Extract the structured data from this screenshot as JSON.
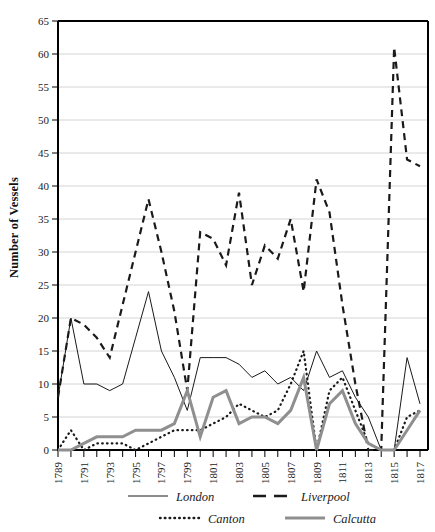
{
  "chart_data": {
    "type": "line",
    "title": "",
    "xlabel": "",
    "ylabel": "Number of Vessels",
    "xlim": [
      1789,
      1817
    ],
    "ylim": [
      0,
      65
    ],
    "ytick_step": 5,
    "xtick_step": 1,
    "xtick_label_step": 2,
    "grid": true,
    "legend_position": "bottom",
    "yticks": [
      0,
      5,
      10,
      15,
      20,
      25,
      30,
      35,
      40,
      45,
      50,
      55,
      60,
      65
    ],
    "ytick_labels": [
      "0",
      "5",
      "10",
      "15",
      "20",
      "25",
      "30",
      "35",
      "40",
      "45",
      "50",
      "55",
      "60",
      "65"
    ],
    "x": [
      1789,
      1790,
      1791,
      1792,
      1793,
      1794,
      1795,
      1796,
      1797,
      1798,
      1799,
      1800,
      1801,
      1802,
      1803,
      1804,
      1805,
      1806,
      1807,
      1808,
      1809,
      1810,
      1811,
      1812,
      1813,
      1814,
      1815,
      1816,
      1817
    ],
    "xtick_labels": [
      "1789",
      "",
      "1791",
      "",
      "1793",
      "",
      "1795",
      "",
      "1797",
      "",
      "1799",
      "",
      "1801",
      "",
      "1803",
      "",
      "1805",
      "",
      "1807",
      "",
      "1809",
      "",
      "1811",
      "",
      "1813",
      "",
      "1815",
      "",
      "1817"
    ],
    "series": [
      {
        "name": "London",
        "style": "solid-thin",
        "color": "#1a1a1a",
        "width": 1,
        "values": [
          8,
          20,
          10,
          10,
          9,
          10,
          17,
          24,
          15,
          11,
          6,
          14,
          14,
          14,
          13,
          11,
          12,
          10,
          11,
          9,
          15,
          11,
          12,
          8,
          5,
          0,
          0,
          14,
          7
        ]
      },
      {
        "name": "Liverpool",
        "style": "dashed",
        "color": "#1a1a1a",
        "width": 2.2,
        "values": [
          8,
          20,
          19,
          17,
          14,
          22,
          30,
          38,
          30,
          21,
          9,
          33,
          32,
          28,
          39,
          25,
          31,
          29,
          35,
          24,
          41,
          36,
          22,
          10,
          0,
          0,
          61,
          44,
          43
        ]
      },
      {
        "name": "Canton",
        "style": "dotted",
        "color": "#1a1a1a",
        "width": 2.2,
        "values": [
          0,
          3,
          0,
          1,
          1,
          1,
          0,
          1,
          2,
          3,
          3,
          3,
          4,
          5,
          7,
          6,
          5,
          6,
          10,
          15,
          0,
          9,
          11,
          6,
          1,
          0,
          0,
          5,
          6
        ]
      },
      {
        "name": "Calcutta",
        "style": "solid-thick-gray",
        "color": "#8f8f8f",
        "width": 3,
        "values": [
          0,
          0,
          1,
          2,
          2,
          2,
          3,
          3,
          3,
          4,
          9,
          2,
          8,
          9,
          4,
          5,
          5,
          4,
          6,
          11,
          0,
          7,
          9,
          4,
          1,
          0,
          0,
          3,
          6
        ]
      }
    ],
    "legend": [
      {
        "label": "London",
        "style": "solid-thin",
        "color": "#1a1a1a"
      },
      {
        "label": "Liverpool",
        "style": "dashed",
        "color": "#1a1a1a"
      },
      {
        "label": "Canton",
        "style": "dotted",
        "color": "#1a1a1a"
      },
      {
        "label": "Calcutta",
        "style": "solid-thick-gray",
        "color": "#8f8f8f"
      }
    ]
  }
}
